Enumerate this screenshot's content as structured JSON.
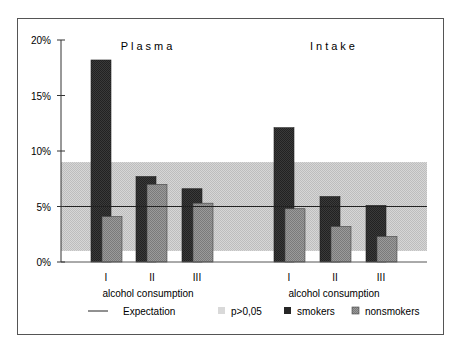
{
  "chart_data": {
    "type": "bar",
    "title": "",
    "ylabel": "",
    "ylim": [
      0,
      20
    ],
    "y_ticks": [
      "0%",
      "5%",
      "10%",
      "15%",
      "20%"
    ],
    "grid": false,
    "legend_position": "bottom",
    "expectation_line": 5,
    "significance_band": {
      "label": "p>0,05",
      "low": 1,
      "high": 9
    },
    "panels": [
      {
        "title": "Plasma",
        "xlabel": "alcohol consumption",
        "categories": [
          "I",
          "II",
          "III"
        ],
        "series": [
          {
            "name": "smokers",
            "values": [
              18.2,
              7.7,
              6.6
            ]
          },
          {
            "name": "nonsmokers",
            "values": [
              4.1,
              7.0,
              5.3
            ]
          }
        ]
      },
      {
        "title": "Intake",
        "xlabel": "alcohol consumption",
        "categories": [
          "I",
          "II",
          "III"
        ],
        "series": [
          {
            "name": "smokers",
            "values": [
              12.1,
              5.9,
              5.1
            ]
          },
          {
            "name": "nonsmokers",
            "values": [
              4.8,
              3.2,
              2.3
            ]
          }
        ]
      }
    ]
  },
  "legend": {
    "expectation": "Expectation",
    "band": "p>0,05",
    "smokers": "smokers",
    "nonsmokers": "nonsmokers"
  },
  "colors": {
    "smokers": "#363636",
    "nonsmokers": "#8c8c8c",
    "band": "#cfcfcf",
    "line": "#222222"
  }
}
